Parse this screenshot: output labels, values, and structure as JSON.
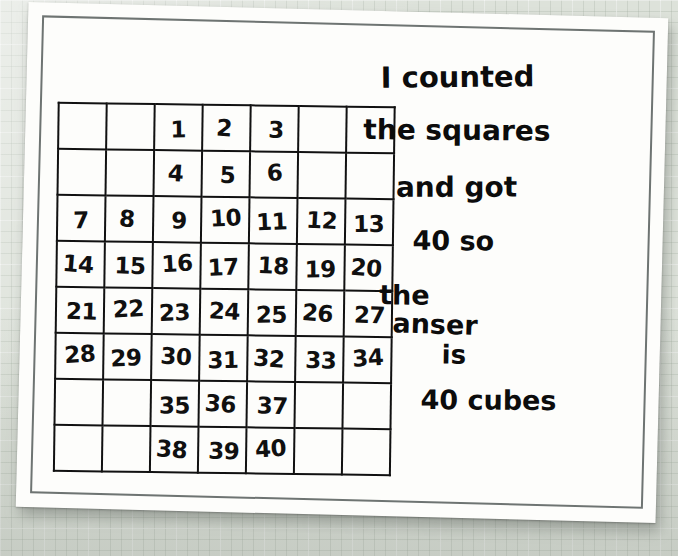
{
  "scene": {
    "media": "photograph-of-student-worksheet",
    "background_color": "#dde2da",
    "paper_color": "#fdfdfb",
    "ink_color": "#101010",
    "border_color": "#6e7472"
  },
  "grid": {
    "columns": 7,
    "rows": 8,
    "cells": [
      [
        "",
        "",
        "1",
        "2",
        "3",
        "",
        ""
      ],
      [
        "",
        "",
        "4",
        "5",
        "6",
        "",
        ""
      ],
      [
        "7",
        "8",
        "9",
        "10",
        "11",
        "12",
        "13"
      ],
      [
        "14",
        "15",
        "16",
        "17",
        "18",
        "19",
        "20"
      ],
      [
        "21",
        "22",
        "23",
        "24",
        "25",
        "26",
        "27"
      ],
      [
        "28",
        "29",
        "30",
        "31",
        "32",
        "33",
        "34"
      ],
      [
        "",
        "",
        "35",
        "36",
        "37",
        "",
        ""
      ],
      [
        "",
        "",
        "38",
        "39",
        "40",
        "",
        ""
      ]
    ],
    "filled_count": 40
  },
  "note": {
    "lines": [
      "I counted",
      "the squares",
      "and got",
      "40 so",
      "the",
      "anser",
      "is",
      "40 cubes"
    ],
    "full_text": "I counted the squares and got 40 so the anser is 40 cubes"
  }
}
